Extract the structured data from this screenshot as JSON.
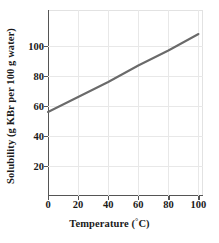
{
  "chart_data": {
    "type": "line",
    "title": "",
    "xlabel": "Temperature (°C)",
    "xlabel_base": "Temperature (",
    "xlabel_degree": "°",
    "xlabel_tail": "C)",
    "ylabel": "Solubility (g KBr per 100 g water)",
    "xlim": [
      0,
      103
    ],
    "ylim": [
      0,
      124
    ],
    "grid": true,
    "legend": "none",
    "xticks": [
      0,
      20,
      40,
      60,
      80,
      100
    ],
    "xtick_labels": [
      "0",
      "20",
      "40",
      "60",
      "80",
      "100"
    ],
    "yticks": [
      20,
      40,
      60,
      80,
      100
    ],
    "ytick_labels": [
      "20",
      "40",
      "60",
      "80",
      "100"
    ],
    "series": [
      {
        "name": "KBr solubility",
        "color": "#6a6a6a",
        "linewidth": 2,
        "x": [
          0,
          20,
          40,
          60,
          80,
          100
        ],
        "values": [
          56,
          66,
          76,
          87,
          97,
          108
        ]
      }
    ],
    "line_color": "#6a6a6a",
    "grid_color": "#e8e8e8",
    "axis_color": "#555555",
    "text_color": "#1a1a1a",
    "background": "#ffffff"
  }
}
